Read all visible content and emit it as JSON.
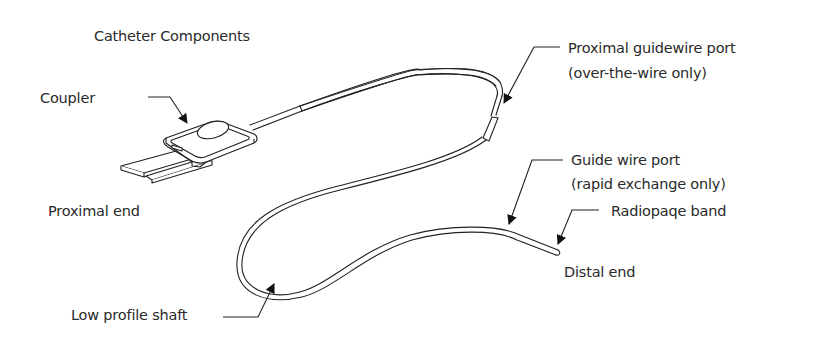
{
  "diagram": {
    "title": "Catheter Components",
    "colors": {
      "line": "#222222",
      "text": "#2a2a2a",
      "background": "#ffffff"
    },
    "labels": {
      "coupler": "Coupler",
      "proximal_end": "Proximal end",
      "proximal_guidewire_port_line1": "Proximal guidewire port",
      "proximal_guidewire_port_line2": "(over-the-wire only)",
      "guide_wire_port_line1": "Guide wire port",
      "guide_wire_port_line2": "(rapid exchange only)",
      "radiopaque_band": "Radiopaqe band",
      "distal_end": "Distal end",
      "low_profile_shaft": "Low profile shaft"
    },
    "components": [
      "coupler",
      "proximal-end",
      "proximal-guidewire-port",
      "guide-wire-port",
      "radiopaque-band",
      "distal-end",
      "low-profile-shaft"
    ]
  }
}
